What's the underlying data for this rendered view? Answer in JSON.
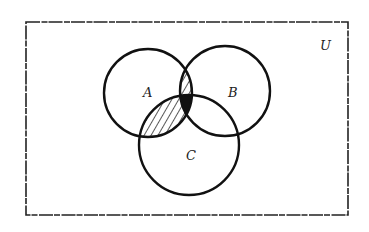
{
  "diagram": {
    "type": "venn",
    "universe_label": "U",
    "sets": [
      {
        "label": "A",
        "cx": 148,
        "cy": 93,
        "r": 44,
        "label_x": 143,
        "label_y": 97
      },
      {
        "label": "B",
        "cx": 225,
        "cy": 91,
        "r": 45,
        "label_x": 228,
        "label_y": 97
      },
      {
        "label": "C",
        "cx": 189,
        "cy": 145,
        "r": 50,
        "label_x": 186,
        "label_y": 160
      }
    ],
    "universe_rect": {
      "x": 26,
      "y": 22,
      "w": 322,
      "h": 193,
      "label_x": 320,
      "label_y": 50
    },
    "shaded_regions": [
      {
        "region": "A∩B∩C'",
        "style": "hatched"
      },
      {
        "region": "A∩C∩B'",
        "style": "hatched"
      },
      {
        "region": "A∩B∩C",
        "style": "solid"
      }
    ],
    "colors": {
      "stroke": "#111111",
      "fill_solid": "#111111",
      "background": "#ffffff"
    }
  }
}
